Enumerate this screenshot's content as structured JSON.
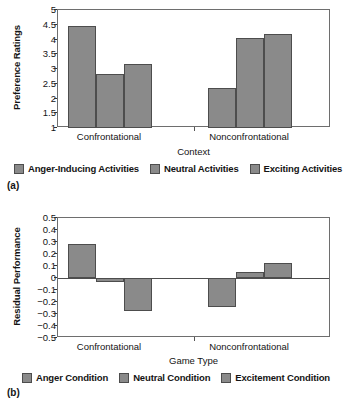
{
  "figure": {
    "credit": "From Tamir, M., Mitchell, C., and Gross, J.J. (2008) Hedonic and instrumental motives in anger regulation.  Psychological Science 19(4), 324-327. Reprinted by permission of Blackwell Publishing Ltd.",
    "panel_a_tag": "(a)",
    "panel_b_tag": "(b)",
    "bar_color": "#8a8a8a",
    "bar_border_color": "#4d4d4d",
    "axis_color": "#6e6e6e"
  },
  "chart_data": [
    {
      "id": "panel-a",
      "type": "bar",
      "title": "",
      "xlabel": "Context",
      "ylabel": "Preference Ratings",
      "categories": [
        "Confrontational",
        "Nonconfrontational"
      ],
      "ylim": [
        1,
        5
      ],
      "yticks": [
        "1",
        "1.5",
        "2",
        "2.5",
        "3",
        "3.5",
        "4",
        "4.5",
        "5"
      ],
      "ytick_values": [
        1,
        1.5,
        2,
        2.5,
        3,
        3.5,
        4,
        4.5,
        5
      ],
      "grid": false,
      "legend_position": "bottom",
      "series": [
        {
          "name": "Anger-Inducing Activities",
          "values": [
            4.45,
            2.35
          ]
        },
        {
          "name": "Neutral Activities",
          "values": [
            2.82,
            4.05
          ]
        },
        {
          "name": "Exciting Activities",
          "values": [
            3.17,
            4.2
          ]
        }
      ]
    },
    {
      "id": "panel-b",
      "type": "bar",
      "title": "",
      "xlabel": "Game Type",
      "ylabel": "Residual Performance",
      "categories": [
        "Confrontational",
        "Nonconfrontational"
      ],
      "ylim": [
        -0.5,
        0.5
      ],
      "yticks": [
        "0.5",
        "0.4",
        "0.3",
        "0.2",
        "0.1",
        "0",
        "−0.1",
        "−0.2",
        "−0.3",
        "−0.4",
        "−0.5"
      ],
      "ytick_values": [
        0.5,
        0.4,
        0.3,
        0.2,
        0.1,
        0,
        -0.1,
        -0.2,
        -0.3,
        -0.4,
        -0.5
      ],
      "grid": false,
      "legend_position": "bottom",
      "series": [
        {
          "name": "Anger Condition",
          "values": [
            0.28,
            -0.24
          ]
        },
        {
          "name": "Neutral Condition",
          "values": [
            -0.03,
            0.05
          ]
        },
        {
          "name": "Excitement Condition",
          "values": [
            -0.275,
            0.125
          ]
        }
      ]
    }
  ]
}
